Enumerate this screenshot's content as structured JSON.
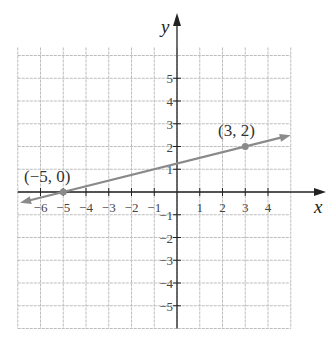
{
  "chart_data": {
    "type": "line",
    "title": "",
    "xlabel": "x",
    "ylabel": "y",
    "xlim": [
      -7,
      5
    ],
    "ylim": [
      -6,
      6
    ],
    "grid": true,
    "x_ticks": [
      "-6",
      "-5",
      "-4",
      "-3",
      "-2",
      "-1",
      "1",
      "2",
      "3",
      "4"
    ],
    "y_ticks": [
      "5",
      "4",
      "3",
      "2",
      "1",
      "-1",
      "-2",
      "-3",
      "-4",
      "-5"
    ],
    "series": [
      {
        "name": "line through (-5,0) and (3,2)",
        "x": [
          -5,
          3
        ],
        "y": [
          0,
          2
        ],
        "slope": 0.25,
        "intercept": 1.25
      }
    ],
    "points": [
      {
        "x": -5,
        "y": 0,
        "label": "(−5, 0)"
      },
      {
        "x": 3,
        "y": 2,
        "label": "(3, 2)"
      }
    ],
    "annotations": [
      "(−5, 0)",
      "(3, 2)"
    ]
  },
  "labels": {
    "x_axis": "x",
    "y_axis": "y",
    "point_a": "(−5, 0)",
    "point_b": "(3, 2)"
  },
  "colors": {
    "grid": "#bdbdbd",
    "axis": "#222222",
    "line": "#8a8a8a"
  }
}
